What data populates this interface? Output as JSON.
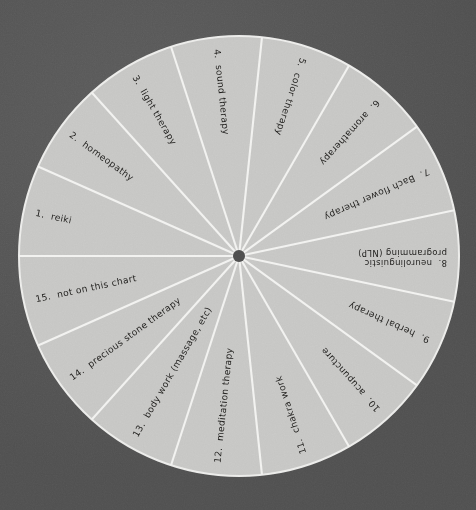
{
  "page": {
    "background_color": "#545454",
    "sector_color": "#c6c6c4",
    "spoke_color": "#f2f2f0",
    "label_color": "#1d1c1a",
    "hub_color": "#4e4e4e"
  },
  "wheel": {
    "center_x": 239,
    "center_y": 256,
    "radius": 220,
    "hub_radius": 6,
    "sector_count": 15,
    "sector_angle_degrees": 24,
    "start_angle_degrees": 0
  },
  "chart_data": {
    "type": "pie",
    "xlabel": "",
    "ylabel": "",
    "legend_position": "none",
    "grid": false,
    "note": "Fifteen equal segments, 24 degrees each, numbered counter-clockwise from the left horizontal (9 o'clock) position.",
    "categories": [
      "1. reiki",
      "2. homeopathy",
      "3. light therapy",
      "4. sound therapy",
      "5. color therapy",
      "6. aromatherapy",
      "7. Bach flower therapy",
      "8. neurolinguistic programming (NLP)",
      "9. herbal therapy",
      "10. acupuncture",
      "11. chakra work",
      "12. meditation therapy",
      "13. body work (massage, etc)",
      "14. precious stone therapy",
      "15. not on this chart"
    ],
    "values": [
      24,
      24,
      24,
      24,
      24,
      24,
      24,
      24,
      24,
      24,
      24,
      24,
      24,
      24,
      24
    ],
    "value_unit": "degrees",
    "percentages": [
      6.67,
      6.67,
      6.67,
      6.67,
      6.67,
      6.67,
      6.67,
      6.67,
      6.67,
      6.67,
      6.67,
      6.67,
      6.67,
      6.67,
      6.67
    ]
  },
  "segments": [
    {
      "number": "1.",
      "label": "reiki",
      "text": "1.  reiki",
      "lines": [
        "1.  reiki"
      ],
      "mid_angle": 168
    },
    {
      "number": "2.",
      "label": "homeopathy",
      "text": "2.  homeopathy",
      "lines": [
        "2.  homeopathy"
      ],
      "mid_angle": 144
    },
    {
      "number": "3.",
      "label": "light therapy",
      "text": "3.  light therapy",
      "lines": [
        "3.  light therapy"
      ],
      "mid_angle": 120
    },
    {
      "number": "4.",
      "label": "sound therapy",
      "text": "4.  sound therapy",
      "lines": [
        "4.  sound therapy"
      ],
      "mid_angle": 96
    },
    {
      "number": "5.",
      "label": "color therapy",
      "text": "5.  color therapy",
      "lines": [
        "5.  color therapy"
      ],
      "mid_angle": 72
    },
    {
      "number": "6.",
      "label": "aromatherapy",
      "text": "6.  aromatherapy",
      "lines": [
        "6.  aromatherapy"
      ],
      "mid_angle": 48
    },
    {
      "number": "7.",
      "label": "Bach flower therapy",
      "text": "7.  Bach flower therapy",
      "lines": [
        "7.  Bach flower therapy"
      ],
      "mid_angle": 24
    },
    {
      "number": "8.",
      "label": "neurolinguistic programming (NLP)",
      "text": "8.  neurolinguistic programming (NLP)",
      "lines": [
        "8.  neurolinguistic",
        "programming (NLP)"
      ],
      "mid_angle": 0
    },
    {
      "number": "9.",
      "label": "herbal therapy",
      "text": "9.  herbal therapy",
      "lines": [
        "9.  herbal therapy"
      ],
      "mid_angle": 336
    },
    {
      "number": "10.",
      "label": "acupuncture",
      "text": "10.  acupuncture",
      "lines": [
        "10.  acupuncture"
      ],
      "mid_angle": 312
    },
    {
      "number": "11.",
      "label": "chakra work",
      "text": "11.  chakra work",
      "lines": [
        "11.  chakra work"
      ],
      "mid_angle": 288
    },
    {
      "number": "12.",
      "label": "meditation therapy",
      "text": "12.  meditation therapy",
      "lines": [
        "12.  meditation therapy"
      ],
      "mid_angle": 264
    },
    {
      "number": "13.",
      "label": "body work (massage, etc)",
      "text": "13.  body work (massage, etc)",
      "lines": [
        "13.  body work (massage, etc)"
      ],
      "mid_angle": 240
    },
    {
      "number": "14.",
      "label": "precious stone therapy",
      "text": "14.  precious stone therapy",
      "lines": [
        "14.  precious stone therapy"
      ],
      "mid_angle": 216
    },
    {
      "number": "15.",
      "label": "not on this chart",
      "text": "15.  not on this chart",
      "lines": [
        "15.  not on this chart"
      ],
      "mid_angle": 192
    }
  ]
}
